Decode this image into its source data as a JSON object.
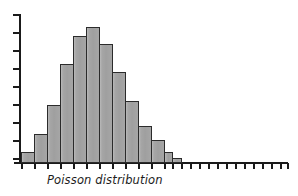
{
  "chart_data": {
    "type": "bar",
    "title": "Poisson distribution",
    "subtitle": "",
    "xlabel": "Poisson distribution",
    "ylabel": "",
    "grid": false,
    "legend": false,
    "legend_position": "none",
    "axis_style": "ticks-only, no tick labels",
    "categories": [
      "0",
      "1",
      "2",
      "3",
      "4",
      "5",
      "6",
      "7",
      "8",
      "9",
      "10",
      "11",
      "12",
      "13",
      "14",
      "15",
      "16",
      "17",
      "18",
      "19",
      "20",
      "21",
      "22",
      "23",
      "24",
      "25",
      "26"
    ],
    "values": [
      11,
      29,
      58,
      99,
      127,
      136,
      119,
      91,
      62,
      37,
      23,
      11,
      5,
      0,
      0,
      0,
      0,
      0,
      0,
      0,
      0,
      0,
      0,
      0,
      0,
      0,
      0
    ],
    "values_note": "bar heights in pixels above baseline; peak at category index 5",
    "ylim": [
      0,
      150
    ],
    "xlim": [
      0,
      26
    ],
    "y_tick_count": 9,
    "x_tick_count": 27,
    "peak_category": "5",
    "peak_value": 136,
    "bar_fill_color": "#a6a6a6",
    "bar_edge_color": "#2b2b2b",
    "axis_color": "#1a1a1a",
    "background_color": "#ffffff"
  },
  "caption": {
    "text": "Poisson distribution"
  },
  "axes": {
    "y_ticks": [
      14,
      32,
      50,
      68,
      86,
      104,
      122,
      140,
      158
    ],
    "x_ticks": [
      21,
      34,
      47,
      60,
      73,
      86,
      99,
      112,
      125,
      138,
      151,
      164,
      172,
      181,
      190,
      199,
      208,
      217,
      226,
      235,
      244,
      253,
      262,
      271,
      280,
      287
    ],
    "baseline_y": 163,
    "y_axis_x": 20
  },
  "bars": [
    {
      "x": 21,
      "w": 14,
      "h": 11,
      "label": "0"
    },
    {
      "x": 34,
      "w": 14,
      "h": 29,
      "label": "1"
    },
    {
      "x": 47,
      "w": 14,
      "h": 58,
      "label": "2"
    },
    {
      "x": 60,
      "w": 14,
      "h": 99,
      "label": "3"
    },
    {
      "x": 73,
      "w": 14,
      "h": 127,
      "label": "4"
    },
    {
      "x": 86,
      "w": 14,
      "h": 136,
      "label": "5"
    },
    {
      "x": 99,
      "w": 14,
      "h": 119,
      "label": "6"
    },
    {
      "x": 112,
      "w": 14,
      "h": 91,
      "label": "7"
    },
    {
      "x": 125,
      "w": 14,
      "h": 62,
      "label": "8"
    },
    {
      "x": 138,
      "w": 14,
      "h": 37,
      "label": "9"
    },
    {
      "x": 151,
      "w": 14,
      "h": 23,
      "label": "10"
    },
    {
      "x": 164,
      "w": 9,
      "h": 11,
      "label": "11"
    },
    {
      "x": 172,
      "w": 10,
      "h": 5,
      "label": "12"
    }
  ]
}
